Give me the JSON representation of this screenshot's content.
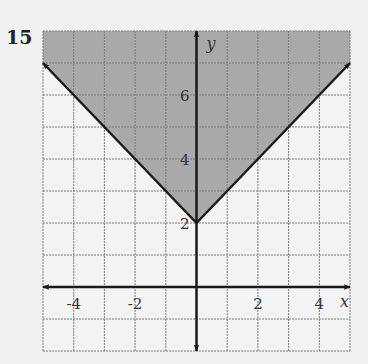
{
  "problem_number": "15",
  "chart_data": {
    "type": "inequality-graph",
    "title": "",
    "inequality": "y >= |x| + 2",
    "boundary": {
      "vertex": [
        0,
        2
      ],
      "slopes": [
        -1,
        1
      ],
      "style": "solid",
      "endpoints": [
        [
          -5,
          7
        ],
        [
          5,
          7
        ]
      ]
    },
    "shaded_region": "above boundary (y >= |x| + 2)",
    "xlim": [
      -5,
      5
    ],
    "ylim": [
      -2,
      8
    ],
    "grid": true,
    "grid_step": 1,
    "xlabel": "x",
    "ylabel": "y",
    "x_ticks": [
      {
        "value": -4,
        "label": "-4"
      },
      {
        "value": -2,
        "label": "-2"
      },
      {
        "value": 2,
        "label": "2"
      },
      {
        "value": 4,
        "label": "4"
      }
    ],
    "y_ticks": [
      {
        "value": 2,
        "label": "2"
      },
      {
        "value": 4,
        "label": "4"
      },
      {
        "value": 6,
        "label": "6"
      }
    ],
    "colors": {
      "shade": "#a9a9a9",
      "grid": "#7a7a7a",
      "axis": "#1a1a1a",
      "background": "#f1f1f1"
    }
  }
}
